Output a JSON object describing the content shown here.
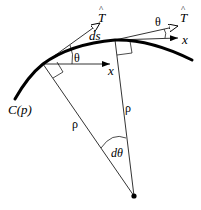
{
  "diagram": {
    "labels": {
      "curve": "C(p)",
      "tangent_1": "T",
      "tangent_2": "T",
      "tangent_hat": "^",
      "arc_length": "ds",
      "angle_1": "θ",
      "angle_2": "θ",
      "x_axis_1": "x",
      "x_axis_2": "x",
      "radius_1": "ρ",
      "radius_2": "ρ",
      "angle_center": "dθ"
    },
    "colors": {
      "stroke": "#000000",
      "background": "#ffffff"
    }
  }
}
